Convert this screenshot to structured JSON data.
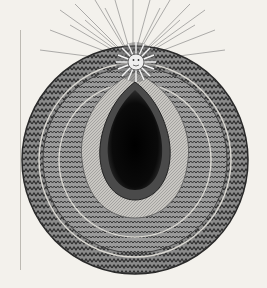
{
  "image": {
    "subject": "engraving",
    "elements": [
      "sun-with-face",
      "radiating-rays",
      "concentric-zigzag-rings",
      "dark-central-void"
    ]
  },
  "colors": {
    "paper": "#f3f1ec",
    "ink": "#1a1a1a",
    "mid_gray": "#6d6d6d",
    "light_gray": "#b9b7b2"
  }
}
